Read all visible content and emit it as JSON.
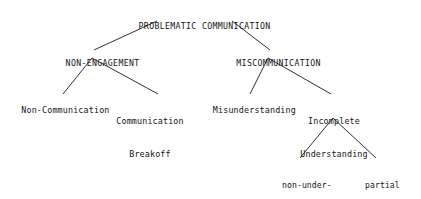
{
  "diagram": {
    "title": "PROBLEMATIC COMMUNICATION",
    "type": "hierarchical-tree-taxonomy",
    "background_color": "#ffffff",
    "text_color": "#151515",
    "line_color": "#1a1a1a",
    "nodes": {
      "root": {
        "label": "PROBLEMATIC COMMUNICATION",
        "level": 1
      },
      "non_engagement": {
        "label": "NON-ENGAGEMENT",
        "level": 2
      },
      "miscommunication": {
        "label": "MISCOMMUNICATION",
        "level": 2
      },
      "non_communication": {
        "label": "Non-Communication",
        "level": 3
      },
      "communication_breakoff": {
        "line1": "Communication",
        "line2": "Breakoff",
        "level": 3
      },
      "misunderstanding": {
        "label": "Misunderstanding",
        "level": 3
      },
      "incomplete_understanding": {
        "line1": "Incomplete",
        "line2": "Understanding",
        "level": 3
      },
      "non_understanding": {
        "line1": "non-under-",
        "line2": "standing",
        "level": 4
      },
      "partial_understanding": {
        "line1": "partial",
        "line2": "under-",
        "line3": "standing",
        "level": 4
      }
    },
    "edges": [
      {
        "from": "root",
        "to": "non_engagement"
      },
      {
        "from": "root",
        "to": "miscommunication"
      },
      {
        "from": "non_engagement",
        "to": "non_communication"
      },
      {
        "from": "non_engagement",
        "to": "communication_breakoff"
      },
      {
        "from": "miscommunication",
        "to": "misunderstanding"
      },
      {
        "from": "miscommunication",
        "to": "incomplete_understanding"
      },
      {
        "from": "incomplete_understanding",
        "to": "non_understanding"
      },
      {
        "from": "incomplete_understanding",
        "to": "partial_understanding"
      }
    ]
  }
}
